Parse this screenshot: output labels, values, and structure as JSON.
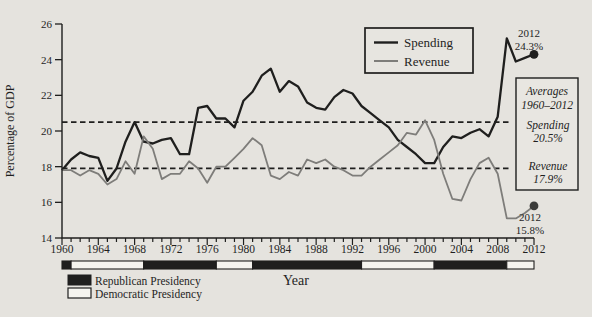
{
  "figure": {
    "background_color": "#e5e3de",
    "ink_color": "#1f1f1e",
    "revenue_color": "#7e7d7a",
    "democrat_fill": "#f5f4ef"
  },
  "axes": {
    "y_label": "Percentage of GDP",
    "x_label": "Year",
    "y_ticks": [
      "26",
      "24",
      "22",
      "20",
      "18",
      "16",
      "14"
    ],
    "x_ticks": [
      "1960",
      "1964",
      "1968",
      "1972",
      "1976",
      "1980",
      "1984",
      "1988",
      "1992",
      "1996",
      "2000",
      "2004",
      "2008",
      "2012"
    ]
  },
  "legend": {
    "spending_label": "Spending",
    "revenue_label": "Revenue"
  },
  "averages_box": {
    "title_line1": "Averages",
    "title_line2": "1960–2012",
    "spending_label": "Spending",
    "spending_value": "20.5%",
    "revenue_label": "Revenue",
    "revenue_value": "17.9%"
  },
  "annotations": {
    "spending_end_year": "2012",
    "spending_end_value": "24.3%",
    "revenue_end_year": "2012",
    "revenue_end_value": "15.8%"
  },
  "presidency": {
    "republican_label": "Republican Presidency",
    "democratic_label": "Democratic Presidency",
    "segments": [
      {
        "from": 1960,
        "to": 1961,
        "party": "R"
      },
      {
        "from": 1961,
        "to": 1969,
        "party": "D"
      },
      {
        "from": 1969,
        "to": 1977,
        "party": "R"
      },
      {
        "from": 1977,
        "to": 1981,
        "party": "D"
      },
      {
        "from": 1981,
        "to": 1993,
        "party": "R"
      },
      {
        "from": 1993,
        "to": 2001,
        "party": "D"
      },
      {
        "from": 2001,
        "to": 2009,
        "party": "R"
      },
      {
        "from": 2009,
        "to": 2012,
        "party": "D"
      }
    ]
  },
  "chart_data": {
    "type": "line",
    "title": "",
    "xlabel": "Year",
    "ylabel": "Percentage of GDP",
    "xlim": [
      1960,
      2012
    ],
    "ylim": [
      14,
      26
    ],
    "x_tick_step": 4,
    "y_tick_step": 2,
    "grid": false,
    "legend_position": "top-center",
    "x": [
      1960,
      1961,
      1962,
      1963,
      1964,
      1965,
      1966,
      1967,
      1968,
      1969,
      1970,
      1971,
      1972,
      1973,
      1974,
      1975,
      1976,
      1977,
      1978,
      1979,
      1980,
      1981,
      1982,
      1983,
      1984,
      1985,
      1986,
      1987,
      1988,
      1989,
      1990,
      1991,
      1992,
      1993,
      1994,
      1995,
      1996,
      1997,
      1998,
      1999,
      2000,
      2001,
      2002,
      2003,
      2004,
      2005,
      2006,
      2007,
      2008,
      2009,
      2010,
      2011,
      2012
    ],
    "series": [
      {
        "name": "Spending",
        "color": "#1f1f1e",
        "average": 20.5,
        "end_dot_value": 24.3,
        "values": [
          17.8,
          18.4,
          18.8,
          18.6,
          18.5,
          17.2,
          17.9,
          19.4,
          20.5,
          19.4,
          19.3,
          19.5,
          19.6,
          18.7,
          18.7,
          21.3,
          21.4,
          20.7,
          20.7,
          20.2,
          21.7,
          22.2,
          23.1,
          23.5,
          22.2,
          22.8,
          22.5,
          21.6,
          21.3,
          21.2,
          21.9,
          22.3,
          22.1,
          21.4,
          21.0,
          20.6,
          20.2,
          19.5,
          19.1,
          18.7,
          18.2,
          18.2,
          19.1,
          19.7,
          19.6,
          19.9,
          20.1,
          19.7,
          20.8,
          25.2,
          23.9,
          24.1,
          24.3
        ]
      },
      {
        "name": "Revenue",
        "color": "#7e7d7a",
        "average": 17.9,
        "end_dot_value": 15.8,
        "values": [
          17.8,
          17.8,
          17.5,
          17.8,
          17.6,
          17.0,
          17.3,
          18.3,
          17.6,
          19.7,
          19.0,
          17.3,
          17.6,
          17.6,
          18.3,
          17.9,
          17.1,
          18.0,
          18.0,
          18.5,
          19.0,
          19.6,
          19.2,
          17.5,
          17.3,
          17.7,
          17.5,
          18.4,
          18.2,
          18.4,
          18.0,
          17.8,
          17.5,
          17.5,
          18.0,
          18.4,
          18.8,
          19.2,
          19.9,
          19.8,
          20.6,
          19.5,
          17.6,
          16.2,
          16.1,
          17.3,
          18.2,
          18.5,
          17.6,
          15.1,
          15.1,
          15.4,
          15.8
        ]
      }
    ],
    "average_lines": [
      {
        "series": "Spending",
        "value": 20.5,
        "style": "dashed"
      },
      {
        "series": "Revenue",
        "value": 17.9,
        "style": "dashed"
      }
    ]
  }
}
